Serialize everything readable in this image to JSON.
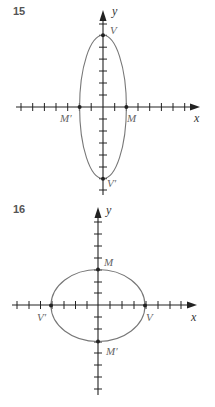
{
  "problems": [
    {
      "number": "15",
      "axis_labels": {
        "x": "x",
        "y": "y"
      },
      "ellipse": {
        "semi_major_axis": "vertical",
        "a": 6,
        "b": 2
      },
      "points": [
        {
          "name": "V",
          "label": "V",
          "x": 0,
          "y": 6
        },
        {
          "name": "V-prime",
          "label": "V′",
          "x": 0,
          "y": -6
        },
        {
          "name": "M",
          "label": "M",
          "x": 2,
          "y": 0
        },
        {
          "name": "M-prime",
          "label": "M′",
          "x": -2,
          "y": 0
        }
      ]
    },
    {
      "number": "16",
      "axis_labels": {
        "x": "x",
        "y": "y"
      },
      "ellipse": {
        "semi_major_axis": "horizontal",
        "a": 4,
        "b": 3
      },
      "points": [
        {
          "name": "V",
          "label": "V",
          "x": 4,
          "y": 0
        },
        {
          "name": "V-prime",
          "label": "V′",
          "x": -4,
          "y": 0
        },
        {
          "name": "M",
          "label": "M",
          "x": 0,
          "y": 3
        },
        {
          "name": "M-prime",
          "label": "M′",
          "x": 0,
          "y": -3
        }
      ]
    }
  ],
  "colors": {
    "axis": "#222222",
    "curve": "#777777",
    "label": "#666666"
  }
}
